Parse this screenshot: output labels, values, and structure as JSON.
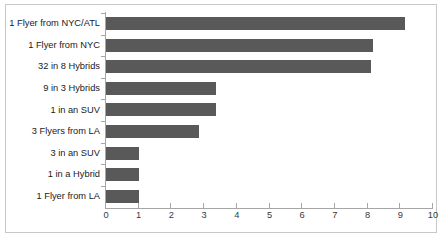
{
  "chart_data": {
    "type": "bar",
    "orientation": "horizontal",
    "title": "",
    "subtitle": "",
    "xlabel": "",
    "ylabel": "",
    "categories": [
      "1 Flyer from NYC/ATL",
      "1 Flyer from NYC",
      "32 in 8 Hybrids",
      "9 in 3 Hybrids",
      "1 in an SUV",
      "3 Flyers from LA",
      "3 in an SUV",
      "1 in a Hybrid",
      "1 Flyer from LA"
    ],
    "values": [
      9.15,
      8.15,
      8.1,
      3.35,
      3.35,
      2.85,
      1.0,
      1.0,
      1.0
    ],
    "xlim": [
      0,
      10
    ],
    "xticks": [
      0,
      1,
      2,
      3,
      4,
      5,
      6,
      7,
      8,
      9,
      10
    ],
    "xtick_labels": [
      "0",
      "1",
      "2",
      "3",
      "4",
      "5",
      "6",
      "7",
      "8",
      "9",
      "10"
    ],
    "grid": false,
    "legend": false,
    "legend_position": "none",
    "bar_color": "#595959",
    "axis_color": "#a6a6a6",
    "frame_color": "#c8c8c8",
    "background": "#ffffff"
  },
  "caption": {
    "text": ""
  }
}
